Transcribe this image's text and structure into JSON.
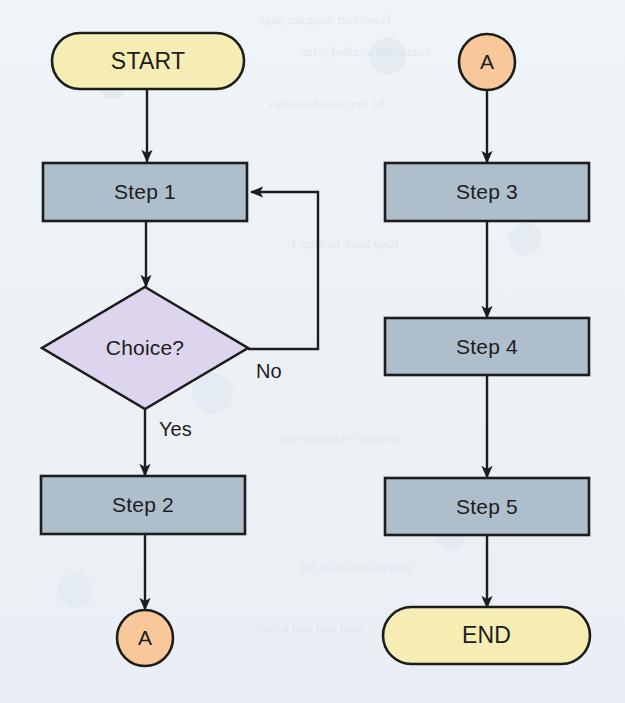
{
  "diagram": {
    "type": "flowchart",
    "background_color": "#eef3f7",
    "colors": {
      "terminator_fill": "#f5edb4",
      "process_fill": "#aebecb",
      "decision_fill": "#ddd5ee",
      "connector_fill": "#f8c89a",
      "stroke": "#1d1d1d",
      "text": "#1d1d1d"
    },
    "nodes": [
      {
        "id": "start",
        "label": "START",
        "shape": "terminator",
        "column": "left",
        "cx": 148,
        "cy": 61,
        "w": 192,
        "h": 56
      },
      {
        "id": "step1",
        "label": "Step 1",
        "shape": "process",
        "column": "left",
        "cx": 145,
        "cy": 192,
        "w": 204,
        "h": 58
      },
      {
        "id": "choice",
        "label": "Choice?",
        "shape": "decision",
        "column": "left",
        "cx": 145,
        "cy": 348,
        "w": 206,
        "h": 122
      },
      {
        "id": "step2",
        "label": "Step 2",
        "shape": "process",
        "column": "left",
        "cx": 143,
        "cy": 505,
        "w": 204,
        "h": 58
      },
      {
        "id": "connA_out",
        "label": "A",
        "shape": "connector",
        "column": "left",
        "cx": 145,
        "cy": 638,
        "r": 28
      },
      {
        "id": "connA_in",
        "label": "A",
        "shape": "connector",
        "column": "right",
        "cx": 487,
        "cy": 62,
        "r": 28
      },
      {
        "id": "step3",
        "label": "Step 3",
        "shape": "process",
        "column": "right",
        "cx": 487,
        "cy": 192,
        "w": 204,
        "h": 58
      },
      {
        "id": "step4",
        "label": "Step 4",
        "shape": "process",
        "column": "right",
        "cx": 487,
        "cy": 346,
        "w": 204,
        "h": 57
      },
      {
        "id": "step5",
        "label": "Step 5",
        "shape": "process",
        "column": "right",
        "cx": 487,
        "cy": 506,
        "w": 204,
        "h": 57
      },
      {
        "id": "end",
        "label": "END",
        "shape": "terminator",
        "column": "right",
        "cx": 487,
        "cy": 635,
        "w": 207,
        "h": 57
      }
    ],
    "edges": [
      {
        "id": "e-start-step1",
        "from": "start",
        "to": "step1",
        "label": ""
      },
      {
        "id": "e-step1-choice",
        "from": "step1",
        "to": "choice",
        "label": ""
      },
      {
        "id": "e-choice-step2",
        "from": "choice",
        "to": "step2",
        "label": "Yes"
      },
      {
        "id": "e-choice-step1",
        "from": "choice",
        "to": "step1",
        "label": "No"
      },
      {
        "id": "e-step2-connA",
        "from": "step2",
        "to": "connA_out",
        "label": ""
      },
      {
        "id": "e-connA-step3",
        "from": "connA_in",
        "to": "step3",
        "label": ""
      },
      {
        "id": "e-step3-step4",
        "from": "step3",
        "to": "step4",
        "label": ""
      },
      {
        "id": "e-step4-step5",
        "from": "step4",
        "to": "step5",
        "label": ""
      },
      {
        "id": "e-step5-end",
        "from": "step5",
        "to": "end",
        "label": ""
      }
    ],
    "edge_labels": {
      "yes": "Yes",
      "no": "No"
    },
    "showthrough_text": [
      "flowchart diagram page",
      "connector symbol joins",
      "the decision branches",
      "loop back to Step 1",
      "process rectangles use",
      "terminator ovals for",
      "start and end points"
    ]
  }
}
